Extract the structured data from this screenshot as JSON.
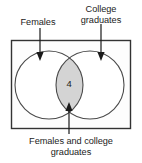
{
  "figure": {
    "type": "venn-diagram",
    "title": "",
    "universe_shape": "rectangle",
    "labels": {
      "left_set": "Females",
      "right_set_line1": "College",
      "right_set_line2": "graduates",
      "intersection_line1": "Females and college",
      "intersection_line2": "graduates"
    },
    "values": {
      "intersection_count": "4"
    },
    "colors": {
      "intersection_fill": "#d4d4d4",
      "circle_stroke": "#4a4a4a",
      "rect_stroke": "#333333",
      "rect_fill": "#fdfdfd",
      "arrow_color": "#1a1a1a",
      "text_color": "#1c1c1c"
    },
    "arrows": [
      {
        "name": "arrow-to-females-circle",
        "direction": "down"
      },
      {
        "name": "arrow-to-college-circle",
        "direction": "down"
      },
      {
        "name": "arrow-to-intersection",
        "direction": "up"
      }
    ]
  }
}
